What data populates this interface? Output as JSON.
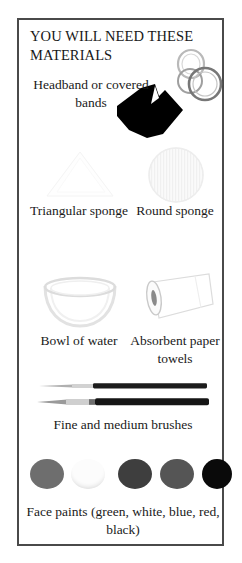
{
  "page": {
    "title": "YOU WILL NEED THESE MATERIALS",
    "border_color": "#4a4a4a",
    "background_color": "#ffffff",
    "text_color": "#1a1a1a"
  },
  "materials": [
    {
      "id": "headband",
      "label": "Headband or covered bands",
      "icon": "headband-silhouette-icon",
      "secondary_icon": "elastic-rings-icon"
    },
    {
      "id": "triangular-sponge",
      "label": "Triangular sponge",
      "icon": "triangular-sponge-icon"
    },
    {
      "id": "round-sponge",
      "label": "Round sponge",
      "icon": "round-sponge-icon"
    },
    {
      "id": "bowl-of-water",
      "label": "Bowl of water",
      "icon": "bowl-of-water-icon"
    },
    {
      "id": "paper-towels",
      "label": "Absorbent paper towels",
      "icon": "paper-towel-roll-icon"
    },
    {
      "id": "brushes",
      "label": "Fine and medium brushes",
      "icon": "paintbrush-icon"
    },
    {
      "id": "face-paints",
      "label": "Face paints (green, white, blue, red, black)",
      "icon": "paint-dots-icon"
    }
  ],
  "face_paints": {
    "caption": "Face paints (green, white, blue, red, black)",
    "swatches": [
      {
        "name": "green",
        "color": "#6e6e6e"
      },
      {
        "name": "white",
        "color": "#fcfcfc"
      },
      {
        "name": "blue",
        "color": "#3e3e3e"
      },
      {
        "name": "red",
        "color": "#555555"
      },
      {
        "name": "black",
        "color": "#0a0a0a"
      }
    ]
  }
}
